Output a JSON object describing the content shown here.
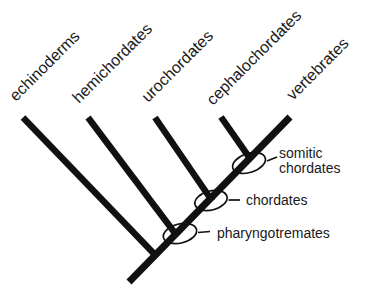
{
  "cladogram": {
    "description": "Cladogram of deuterostome phyla with circled ancestral nodes",
    "taxa": [
      "echinoderms",
      "hemichordates",
      "urochordates",
      "cephalochordates",
      "vertebrates"
    ],
    "clades": [
      {
        "label": "somitic chordates",
        "label_lines": [
          "somitic",
          "chordates"
        ],
        "members": [
          "cephalochordates",
          "vertebrates"
        ]
      },
      {
        "label": "chordates",
        "label_lines": [
          "chordates"
        ],
        "members": [
          "urochordates",
          "cephalochordates",
          "vertebrates"
        ]
      },
      {
        "label": "pharyngotremates",
        "label_lines": [
          "pharyngotremates"
        ],
        "members": [
          "hemichordates",
          "urochordates",
          "cephalochordates",
          "vertebrates"
        ]
      }
    ],
    "topology_newick": "(echinoderms,(hemichordates,(urochordates,(cephalochordates,vertebrates)somitic_chordates)chordates)pharyngotremates);",
    "colors": {
      "line": "#111111",
      "text": "#1a1a1a",
      "background": "#ffffff"
    }
  }
}
